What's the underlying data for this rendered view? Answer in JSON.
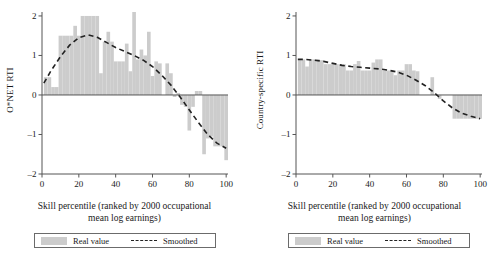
{
  "figure": {
    "background": "#ffffff",
    "bar_color": "#cccccc",
    "line_color": "#222222",
    "axis_color": "#555555"
  },
  "panels": [
    {
      "id": "onet",
      "ylabel": "O*NET RTI",
      "xlabel_line1": "Skill percentile (ranked by 2000 occupational",
      "xlabel_line2": "mean log earnings)",
      "legend": {
        "bar_label": "Real value",
        "line_label": "Smoothed"
      }
    },
    {
      "id": "country-specific",
      "ylabel": "Country-specific RTI",
      "xlabel_line1": "Skill percentile (ranked by 2000 occupational",
      "xlabel_line2": "mean log earnings)",
      "legend": {
        "bar_label": "Real value",
        "line_label": "Smoothed"
      }
    }
  ],
  "chart_data": [
    {
      "type": "bar",
      "id": "onet",
      "title": "",
      "xlabel": "Skill percentile (ranked by 2000 occupational mean log earnings)",
      "ylabel": "O*NET RTI",
      "xlim": [
        0,
        101
      ],
      "ylim": [
        -2,
        2.1
      ],
      "xticks": [
        0,
        20,
        40,
        60,
        80,
        100
      ],
      "yticks": [
        -2,
        -1,
        0,
        1,
        2
      ],
      "grid": false,
      "legend": [
        "Real value",
        "Smoothed"
      ],
      "legend_position": "below",
      "series": [
        {
          "name": "Real value",
          "type": "bar",
          "x": [
            2,
            4,
            6,
            8,
            10,
            12,
            14,
            16,
            18,
            20,
            22,
            24,
            26,
            28,
            30,
            32,
            34,
            36,
            38,
            40,
            42,
            44,
            46,
            48,
            50,
            52,
            54,
            56,
            58,
            60,
            62,
            64,
            66,
            68,
            70,
            72,
            74,
            76,
            78,
            80,
            82,
            84,
            86,
            88,
            90,
            92,
            94,
            96,
            98,
            100
          ],
          "values": [
            0.45,
            0.45,
            0.2,
            0.2,
            1.5,
            1.5,
            1.5,
            1.5,
            1.75,
            1.5,
            2.0,
            2.0,
            2.0,
            2.0,
            2.0,
            0.55,
            1.35,
            1.6,
            1.35,
            0.85,
            0.85,
            0.85,
            1.3,
            0.6,
            2.1,
            0.9,
            1.15,
            1.0,
            1.6,
            0.48,
            0.85,
            0.8,
            0.0,
            0.8,
            0.55,
            -0.05,
            0.05,
            -0.25,
            -0.3,
            -0.9,
            -0.3,
            0.1,
            0.1,
            -1.5,
            -1.1,
            -1.05,
            -1.3,
            -1.3,
            -1.3,
            -1.65
          ]
        },
        {
          "name": "Smoothed",
          "type": "line",
          "x": [
            1,
            5,
            10,
            15,
            20,
            25,
            30,
            35,
            40,
            45,
            50,
            55,
            60,
            65,
            70,
            75,
            80,
            85,
            90,
            95,
            100
          ],
          "values": [
            0.3,
            0.62,
            0.97,
            1.26,
            1.45,
            1.52,
            1.46,
            1.33,
            1.2,
            1.1,
            1.0,
            0.88,
            0.72,
            0.5,
            0.25,
            -0.05,
            -0.38,
            -0.7,
            -1.0,
            -1.22,
            -1.35
          ]
        }
      ]
    },
    {
      "type": "bar",
      "id": "country-specific",
      "title": "",
      "xlabel": "Skill percentile (ranked by 2000 occupational mean log earnings)",
      "ylabel": "Country-specific RTI",
      "xlim": [
        0,
        101
      ],
      "ylim": [
        -2,
        2.1
      ],
      "xticks": [
        0,
        20,
        40,
        60,
        80,
        100
      ],
      "yticks": [
        -2,
        -1,
        0,
        1,
        2
      ],
      "grid": false,
      "legend": [
        "Real value",
        "Smoothed"
      ],
      "legend_position": "below",
      "series": [
        {
          "name": "Real value",
          "type": "bar",
          "x": [
            2,
            4,
            6,
            8,
            10,
            12,
            14,
            16,
            18,
            20,
            22,
            24,
            26,
            28,
            30,
            32,
            34,
            36,
            38,
            40,
            42,
            44,
            46,
            48,
            50,
            52,
            54,
            56,
            58,
            60,
            62,
            64,
            66,
            68,
            70,
            72,
            74,
            76,
            78,
            80,
            82,
            84,
            86,
            88,
            90,
            92,
            94,
            96,
            98,
            100
          ],
          "values": [
            0.9,
            0.9,
            0.72,
            0.9,
            0.9,
            0.9,
            0.88,
            0.78,
            0.78,
            0.78,
            0.78,
            0.78,
            0.78,
            0.62,
            0.62,
            0.78,
            0.86,
            0.62,
            0.62,
            0.62,
            0.82,
            0.9,
            0.9,
            0.62,
            0.62,
            0.62,
            0.5,
            0.62,
            0.62,
            0.78,
            0.78,
            0.62,
            0.6,
            0.0,
            0.0,
            0.0,
            0.45,
            0.0,
            -0.1,
            0.0,
            0.0,
            0.0,
            -0.6,
            -0.6,
            -0.6,
            -0.6,
            -0.6,
            -0.6,
            -0.6,
            -0.6
          ]
        },
        {
          "name": "Smoothed",
          "type": "line",
          "x": [
            1,
            5,
            10,
            15,
            20,
            25,
            30,
            35,
            40,
            45,
            50,
            55,
            60,
            65,
            70,
            75,
            80,
            85,
            90,
            95,
            100
          ],
          "values": [
            0.9,
            0.9,
            0.88,
            0.85,
            0.8,
            0.75,
            0.72,
            0.7,
            0.68,
            0.66,
            0.63,
            0.58,
            0.5,
            0.38,
            0.24,
            0.06,
            -0.15,
            -0.33,
            -0.46,
            -0.54,
            -0.6
          ]
        }
      ]
    }
  ]
}
